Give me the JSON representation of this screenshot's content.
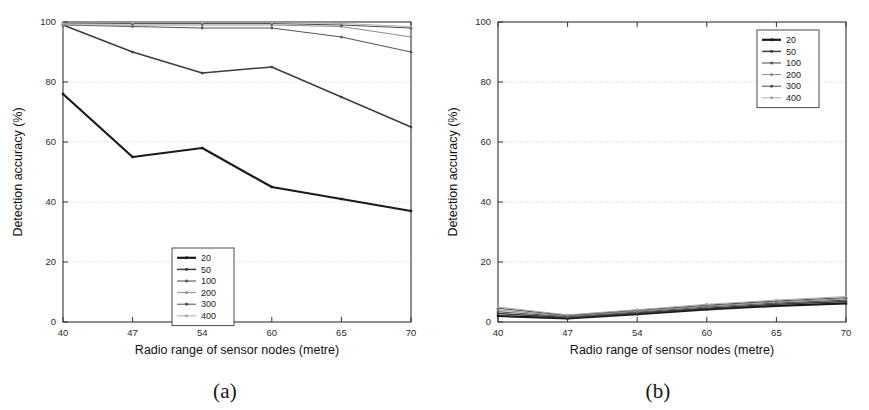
{
  "figure": {
    "subfigures": [
      {
        "id": "a",
        "caption": "(a)",
        "legend_position": "bottom-center"
      },
      {
        "id": "b",
        "caption": "(b)",
        "legend_position": "top-right"
      }
    ]
  },
  "colors": {
    "series_20": "#1a1a1a",
    "series_50": "#3d3d3d",
    "series_100": "#565656",
    "series_200": "#8c8c8c",
    "series_300": "#4a4a4a",
    "series_400": "#a6a6a6",
    "axis": "#333333",
    "grid": "#bdbdbd",
    "background": "#ffffff"
  },
  "chart_data": [
    {
      "type": "line",
      "id": "a",
      "title": "",
      "xlabel": "Radio range of sensor nodes (metre)",
      "ylabel": "Detection accuracy (%)",
      "x": [
        40,
        47,
        54,
        60,
        65,
        70
      ],
      "xticklabels": [
        "40",
        "47",
        "54",
        "60",
        "65",
        "70"
      ],
      "yticklabels": [
        "0",
        "20",
        "40",
        "60",
        "80",
        "100"
      ],
      "xlim": [
        40,
        70
      ],
      "ylim": [
        0,
        100
      ],
      "grid": "horizontal-dotted",
      "legend": [
        "20",
        "50",
        "100",
        "200",
        "300",
        "400"
      ],
      "legend_position": "bottom-center",
      "series": [
        {
          "name": "20",
          "values": [
            76,
            55,
            58,
            45,
            41,
            37
          ]
        },
        {
          "name": "50",
          "values": [
            99,
            90,
            83,
            85,
            75,
            65
          ]
        },
        {
          "name": "100",
          "values": [
            99,
            98.5,
            98,
            98,
            95,
            90
          ]
        },
        {
          "name": "200",
          "values": [
            99,
            99,
            99,
            99,
            98.5,
            95
          ]
        },
        {
          "name": "300",
          "values": [
            99.5,
            99.5,
            99.5,
            99.5,
            99,
            98
          ]
        },
        {
          "name": "400",
          "values": [
            99.5,
            99.8,
            99.8,
            99.8,
            99.5,
            98.5
          ]
        }
      ]
    },
    {
      "type": "line",
      "id": "b",
      "title": "",
      "xlabel": "Radio range of sensor nodes (metre)",
      "ylabel": "Detection accuracy (%)",
      "x": [
        40,
        47,
        54,
        60,
        65,
        70
      ],
      "xticklabels": [
        "40",
        "47",
        "54",
        "60",
        "65",
        "70"
      ],
      "yticklabels": [
        "0",
        "20",
        "40",
        "60",
        "80",
        "100"
      ],
      "xlim": [
        40,
        70
      ],
      "ylim": [
        0,
        100
      ],
      "grid": "horizontal-dotted",
      "legend": [
        "20",
        "50",
        "100",
        "200",
        "300",
        "400"
      ],
      "legend_position": "top-right",
      "series": [
        {
          "name": "20",
          "values": [
            2.0,
            1.2,
            2.6,
            4.2,
            5.4,
            6.2
          ]
        },
        {
          "name": "50",
          "values": [
            2.8,
            1.5,
            3.0,
            4.6,
            5.9,
            6.8
          ]
        },
        {
          "name": "100",
          "values": [
            3.4,
            1.8,
            3.3,
            5.0,
            6.3,
            7.3
          ]
        },
        {
          "name": "200",
          "values": [
            4.0,
            2.0,
            3.6,
            5.3,
            6.7,
            7.7
          ]
        },
        {
          "name": "300",
          "values": [
            4.6,
            2.2,
            3.9,
            5.6,
            7.0,
            8.1
          ]
        },
        {
          "name": "400",
          "values": [
            5.0,
            2.4,
            4.1,
            5.9,
            7.3,
            8.5
          ]
        }
      ]
    }
  ]
}
